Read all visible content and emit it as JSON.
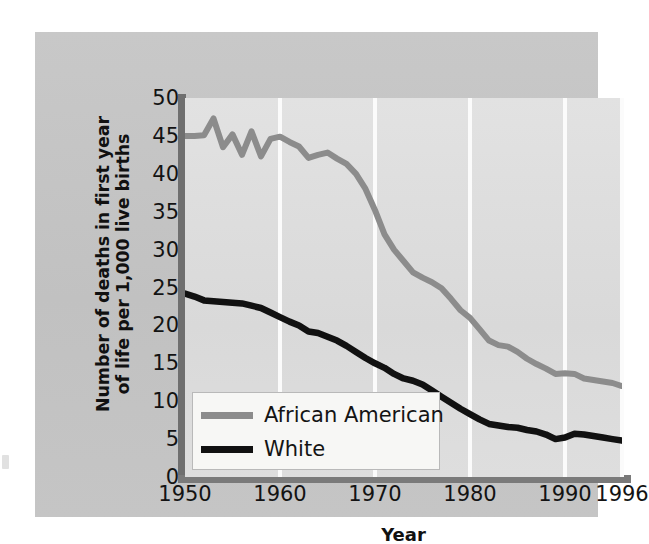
{
  "figure": {
    "background_color": "#c4c4c4",
    "plot_background_color": "#dcdcdc",
    "gridline_color": "#fbfbfb",
    "spine_color": "#6f6f6f"
  },
  "chart_data": {
    "type": "line",
    "title": "",
    "xlabel": "Year",
    "ylabel": "Number of deaths in first year of life per 1,000 live births",
    "ylabel_line1": "Number of deaths in first year",
    "ylabel_line2": "of life per 1,000 live births",
    "xlim": [
      1950,
      1996
    ],
    "ylim": [
      0,
      50
    ],
    "xticks": [
      1950,
      1960,
      1970,
      1980,
      1990,
      1996
    ],
    "xticklabels": [
      "1950",
      "1960",
      "1970",
      "1980",
      "1990",
      "1996"
    ],
    "yticks": [
      0,
      5,
      10,
      15,
      20,
      25,
      30,
      35,
      40,
      45,
      50
    ],
    "yticklabels": [
      "0",
      "5",
      "10",
      "15",
      "20",
      "25",
      "30",
      "35",
      "40",
      "45",
      "50"
    ],
    "grid": "vertical-only",
    "legend_position": "lower-left-inside",
    "series": [
      {
        "name": "African American",
        "color": "#8c8c8c",
        "x": [
          1950,
          1951,
          1952,
          1953,
          1954,
          1955,
          1956,
          1957,
          1958,
          1959,
          1960,
          1961,
          1962,
          1963,
          1964,
          1965,
          1966,
          1967,
          1968,
          1969,
          1970,
          1971,
          1972,
          1973,
          1974,
          1975,
          1976,
          1977,
          1978,
          1979,
          1980,
          1981,
          1982,
          1983,
          1984,
          1985,
          1986,
          1987,
          1988,
          1989,
          1990,
          1991,
          1992,
          1993,
          1994,
          1995,
          1996
        ],
        "values": [
          45.0,
          45.0,
          45.1,
          47.3,
          43.5,
          45.2,
          42.5,
          45.6,
          42.3,
          44.6,
          44.9,
          44.2,
          43.6,
          42.1,
          42.5,
          42.8,
          42.0,
          41.3,
          40.0,
          38.0,
          35.2,
          32.0,
          30.0,
          28.5,
          27.0,
          26.3,
          25.7,
          24.9,
          23.5,
          22.0,
          21.0,
          19.5,
          18.0,
          17.4,
          17.2,
          16.5,
          15.6,
          14.9,
          14.3,
          13.6,
          13.7,
          13.6,
          13.0,
          12.8,
          12.6,
          12.4,
          12.0
        ]
      },
      {
        "name": "White",
        "color": "#111111",
        "x": [
          1950,
          1951,
          1952,
          1953,
          1954,
          1955,
          1956,
          1957,
          1958,
          1959,
          1960,
          1961,
          1962,
          1963,
          1964,
          1965,
          1966,
          1967,
          1968,
          1969,
          1970,
          1971,
          1972,
          1973,
          1974,
          1975,
          1976,
          1977,
          1978,
          1979,
          1980,
          1981,
          1982,
          1983,
          1984,
          1985,
          1986,
          1987,
          1988,
          1989,
          1990,
          1991,
          1992,
          1993,
          1994,
          1995,
          1996
        ],
        "values": [
          24.2,
          23.8,
          23.3,
          23.2,
          23.1,
          23.0,
          22.9,
          22.6,
          22.3,
          21.7,
          21.1,
          20.5,
          20.0,
          19.2,
          19.0,
          18.5,
          18.0,
          17.3,
          16.5,
          15.7,
          15.0,
          14.4,
          13.6,
          13.0,
          12.7,
          12.2,
          11.4,
          10.6,
          9.8,
          9.0,
          8.3,
          7.6,
          7.0,
          6.8,
          6.6,
          6.5,
          6.2,
          6.0,
          5.6,
          5.0,
          5.2,
          5.7,
          5.6,
          5.4,
          5.2,
          5.0,
          4.8
        ]
      }
    ],
    "legend": [
      {
        "label": "African American",
        "color": "#8c8c8c"
      },
      {
        "label": "White",
        "color": "#111111"
      }
    ]
  }
}
